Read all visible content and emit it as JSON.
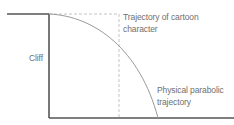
{
  "diagram": {
    "type": "cartoon-vs-physical-trajectory",
    "labels": {
      "cliff": "Cliff",
      "cartoon_line1": "Trajectory of cartoon",
      "cartoon_line2": "character",
      "physical_line1": "Physical parabolic",
      "physical_line2": "trajectory"
    },
    "colors": {
      "cliff_and_ground": "#555555",
      "physical_curve": "#9a9a9a",
      "cartoon_dashed": "#c4c4c4",
      "text": "#6f6f6f",
      "background": "#ffffff"
    }
  }
}
